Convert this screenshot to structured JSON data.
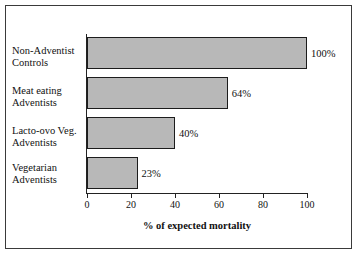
{
  "chart_data": {
    "type": "bar",
    "orientation": "horizontal",
    "title": "",
    "xlabel": "% of expected mortality",
    "ylabel": "",
    "xlim": [
      0,
      100
    ],
    "xticks": [
      "0",
      "20",
      "40",
      "60",
      "80",
      "100"
    ],
    "grid": false,
    "legend": null,
    "categories": [
      "Non-Adventist Controls",
      "Meat eating Adventists",
      "Lacto-ovo Veg. Adventists",
      "Vegetarian Adventists"
    ],
    "values": [
      100,
      64,
      40,
      23
    ],
    "data_labels": [
      "100%",
      "64%",
      "40%",
      "23%"
    ],
    "bars": [
      {
        "label_line1": "Non-Adventist",
        "label_line2": "Controls",
        "value": 100,
        "value_label": "100%"
      },
      {
        "label_line1": "Meat eating",
        "label_line2": "Adventists",
        "value": 64,
        "value_label": "64%"
      },
      {
        "label_line1": "Lacto-ovo Veg.",
        "label_line2": "Adventists",
        "value": 40,
        "value_label": "40%"
      },
      {
        "label_line1": "Vegetarian",
        "label_line2": "Adventists",
        "value": 23,
        "value_label": "23%"
      }
    ],
    "colors": {
      "bar_fill": "#b8b8b8",
      "bar_border": "#1c1c1c",
      "axis": "#222222",
      "text": "#111111",
      "background": "#ffffff",
      "frame": "#3a3a3a"
    }
  }
}
